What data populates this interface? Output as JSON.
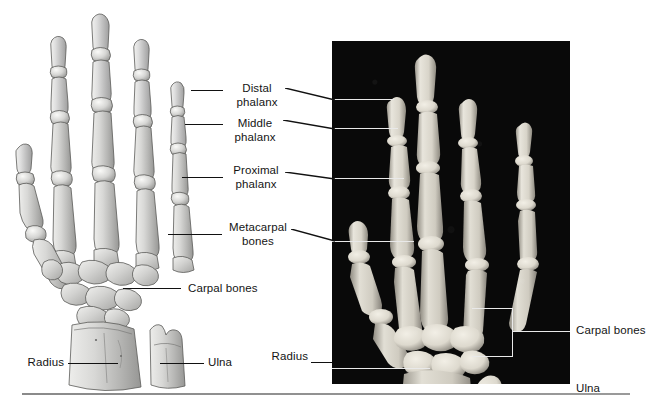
{
  "figure": {
    "background_color": "#ffffff",
    "width": 658,
    "height": 406
  },
  "panels": {
    "left": {
      "name": "illustration",
      "type": "line-drawing",
      "description": "Shaded anatomical drawing of right hand skeleton, dorsal view, with separate distal radius and ulna segment below"
    },
    "right": {
      "name": "radiograph",
      "type": "x-ray-photograph",
      "background_color": "#090909",
      "bone_color": "#e6e3da",
      "description": "Radiograph of the hand and wrist showing the same bones"
    }
  },
  "labels": {
    "distal_phalanx": "Distal\nphalanx",
    "middle_phalanx": "Middle\nphalanx",
    "proximal_phalanx": "Proximal\nphalanx",
    "metacarpal_bones": "Metacarpal\nbones",
    "carpal_bones": "Carpal bones",
    "radius": "Radius",
    "ulna": "Ulna",
    "carpal_bones_xray": "Carpal bones",
    "radius_xray": "Radius",
    "ulna_xray": "Ulna"
  },
  "colors": {
    "text": "#141414",
    "leader_dark": "#111111",
    "leader_light": "#e9e9e9",
    "panel_background": "#090909",
    "rule": "#8a8a8a"
  }
}
